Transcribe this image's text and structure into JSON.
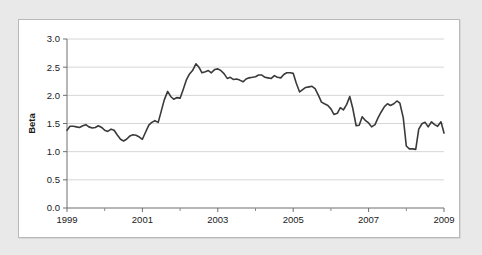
{
  "figure": {
    "background_color": "#e9e9e9",
    "panel_color": "#ffffff",
    "border_color": "#b9b9b9"
  },
  "chart_data": {
    "type": "line",
    "title": "",
    "subtitle": "",
    "xlabel": "",
    "ylabel": "Beta",
    "xlim": [
      1999,
      2009
    ],
    "ylim": [
      0.0,
      3.0
    ],
    "grid": true,
    "grid_axis": "y",
    "legend": "none",
    "line_color": "#3a3a3a",
    "line_width": 1.6,
    "yticks": [
      "0.0",
      "0.5",
      "1.0",
      "1.5",
      "2.0",
      "2.5",
      "3.0"
    ],
    "ytick_values": [
      0.0,
      0.5,
      1.0,
      1.5,
      2.0,
      2.5,
      3.0
    ],
    "xticks": [
      "1999",
      "2001",
      "2003",
      "2005",
      "2007",
      "2009"
    ],
    "xtick_values": [
      1999,
      2001,
      2003,
      2005,
      2007,
      2009
    ],
    "x_minor_ticks": [
      2000,
      2002,
      2004,
      2006,
      2008
    ],
    "series": [
      {
        "name": "Beta",
        "x": [
          1999.0,
          1999.08,
          1999.17,
          1999.25,
          1999.33,
          1999.42,
          1999.5,
          1999.58,
          1999.67,
          1999.75,
          1999.83,
          1999.92,
          2000.0,
          2000.08,
          2000.17,
          2000.25,
          2000.33,
          2000.42,
          2000.5,
          2000.58,
          2000.67,
          2000.75,
          2000.83,
          2000.92,
          2001.0,
          2001.08,
          2001.17,
          2001.25,
          2001.33,
          2001.42,
          2001.5,
          2001.58,
          2001.67,
          2001.75,
          2001.83,
          2001.92,
          2002.0,
          2002.08,
          2002.17,
          2002.25,
          2002.33,
          2002.42,
          2002.5,
          2002.58,
          2002.67,
          2002.75,
          2002.83,
          2002.92,
          2003.0,
          2003.08,
          2003.17,
          2003.25,
          2003.33,
          2003.42,
          2003.5,
          2003.58,
          2003.67,
          2003.75,
          2003.83,
          2003.92,
          2004.0,
          2004.08,
          2004.17,
          2004.25,
          2004.33,
          2004.42,
          2004.5,
          2004.58,
          2004.67,
          2004.75,
          2004.83,
          2004.92,
          2005.0,
          2005.08,
          2005.17,
          2005.25,
          2005.33,
          2005.42,
          2005.5,
          2005.58,
          2005.67,
          2005.75,
          2005.83,
          2005.92,
          2006.0,
          2006.08,
          2006.17,
          2006.25,
          2006.33,
          2006.42,
          2006.5,
          2006.58,
          2006.67,
          2006.75,
          2006.83,
          2006.92,
          2007.0,
          2007.08,
          2007.17,
          2007.25,
          2007.33,
          2007.42,
          2007.5,
          2007.58,
          2007.67,
          2007.75,
          2007.83,
          2007.92,
          2008.0,
          2008.08,
          2008.17,
          2008.25,
          2008.33,
          2008.42,
          2008.5,
          2008.58,
          2008.67,
          2008.75,
          2008.83,
          2008.92,
          2009.0
        ],
        "values": [
          1.38,
          1.45,
          1.45,
          1.44,
          1.43,
          1.46,
          1.48,
          1.44,
          1.42,
          1.43,
          1.46,
          1.43,
          1.38,
          1.36,
          1.4,
          1.38,
          1.3,
          1.22,
          1.19,
          1.22,
          1.28,
          1.3,
          1.29,
          1.26,
          1.22,
          1.34,
          1.47,
          1.52,
          1.55,
          1.52,
          1.72,
          1.92,
          2.07,
          1.98,
          1.93,
          1.96,
          1.95,
          2.1,
          2.28,
          2.38,
          2.44,
          2.56,
          2.5,
          2.4,
          2.42,
          2.44,
          2.4,
          2.46,
          2.47,
          2.44,
          2.38,
          2.3,
          2.32,
          2.28,
          2.29,
          2.27,
          2.24,
          2.29,
          2.31,
          2.32,
          2.33,
          2.36,
          2.36,
          2.32,
          2.31,
          2.3,
          2.35,
          2.32,
          2.31,
          2.37,
          2.4,
          2.4,
          2.39,
          2.22,
          2.06,
          2.1,
          2.14,
          2.15,
          2.16,
          2.12,
          2.0,
          1.88,
          1.85,
          1.82,
          1.76,
          1.66,
          1.68,
          1.78,
          1.74,
          1.84,
          1.98,
          1.77,
          1.46,
          1.47,
          1.62,
          1.55,
          1.51,
          1.44,
          1.48,
          1.6,
          1.7,
          1.8,
          1.85,
          1.82,
          1.85,
          1.9,
          1.86,
          1.6,
          1.1,
          1.05,
          1.05,
          1.04,
          1.4,
          1.5,
          1.52,
          1.44,
          1.53,
          1.48,
          1.45,
          1.53,
          1.33
        ]
      }
    ]
  }
}
